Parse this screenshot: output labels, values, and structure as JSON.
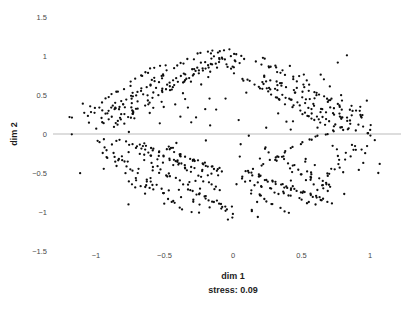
{
  "chart_data": {
    "type": "scatter",
    "title": "",
    "xlabel": "dim 1",
    "ylabel": "dim 2",
    "annotation": "stress: 0.09",
    "xlim": [
      -1.5,
      1.25
    ],
    "ylim": [
      -1.5,
      1.5
    ],
    "grid": false,
    "legend": null,
    "zero_line_y": 0,
    "marker": {
      "color": "#0d0d0d",
      "size_px": 2.3,
      "shape": "circle"
    },
    "xticks": [
      -1,
      -0.5,
      0,
      0.5,
      1
    ],
    "xtick_labels": [
      "−1",
      "−0.5",
      "0",
      "0.5",
      "1"
    ],
    "yticks": [
      1.5,
      1,
      0.5,
      0,
      -0.5,
      -1,
      -1.5
    ],
    "ytick_labels": [
      "1.5",
      "1",
      "0.5",
      "0",
      "−0.5",
      "−1",
      "−1.5"
    ],
    "n_points": 760,
    "x": [
      -1.2,
      -1.16,
      -1.12,
      -1.08,
      -1.05,
      -1.02,
      -0.99,
      -0.97,
      -0.95,
      -0.93,
      -1.1,
      -1.06,
      -1.01,
      -0.98,
      -0.94,
      -0.91,
      -0.89,
      -0.87,
      -0.85,
      -0.83,
      -1.03,
      -0.99,
      -0.96,
      -0.92,
      -0.9,
      -0.88,
      -0.86,
      -0.84,
      -0.82,
      -0.8,
      -0.95,
      -0.92,
      -0.9,
      -0.87,
      -0.85,
      -0.83,
      -0.81,
      -0.79,
      -0.77,
      -0.75,
      -0.91,
      -0.88,
      -0.86,
      -0.84,
      -0.82,
      -0.8,
      -0.78,
      -0.76,
      -0.74,
      -0.72,
      -0.88,
      -0.85,
      -0.83,
      -0.81,
      -0.79,
      -0.77,
      -0.75,
      -0.73,
      -0.71,
      -0.69,
      -0.84,
      -0.82,
      -0.8,
      -0.78,
      -0.76,
      -0.74,
      -0.72,
      -0.7,
      -0.68,
      -0.66,
      -0.8,
      -0.78,
      -0.76,
      -0.74,
      -0.72,
      -0.7,
      -0.68,
      -0.66,
      -0.64,
      -0.62,
      -0.77,
      -0.75,
      -0.73,
      -0.71,
      -0.69,
      -0.67,
      -0.65,
      -0.63,
      -0.61,
      -0.59,
      -0.74,
      -0.72,
      -0.7,
      -0.68,
      -0.66,
      -0.64,
      -0.62,
      -0.6,
      -0.58,
      -0.56,
      -0.71,
      -0.69,
      -0.67,
      -0.65,
      -0.63,
      -0.61,
      -0.59,
      -0.57,
      -0.55,
      -0.53,
      -0.68,
      -0.66,
      -0.64,
      -0.62,
      -0.6,
      -0.58,
      -0.56,
      -0.54,
      -0.52,
      -0.5,
      -0.65,
      -0.63,
      -0.61,
      -0.59,
      -0.57,
      -0.55,
      -0.53,
      -0.51,
      -0.49,
      -0.47,
      -0.62,
      -0.6,
      -0.58,
      -0.56,
      -0.54,
      -0.52,
      -0.5,
      -0.48,
      -0.46,
      -0.44,
      -0.59,
      -0.57,
      -0.55,
      -0.53,
      -0.51,
      -0.49,
      -0.47,
      -0.45,
      -0.43,
      -0.41,
      -0.56,
      -0.54,
      -0.52,
      -0.5,
      -0.48,
      -0.46,
      -0.44,
      -0.42,
      -0.4,
      -0.38,
      -0.53,
      -0.51,
      -0.49,
      -0.47,
      -0.45,
      -0.43,
      -0.41,
      -0.39,
      -0.37,
      -0.35,
      -0.5,
      -0.48,
      -0.46,
      -0.44,
      -0.42,
      -0.4,
      -0.38,
      -0.36,
      -0.34,
      -0.32,
      -0.47,
      -0.45,
      -0.43,
      -0.41,
      -0.39,
      -0.37,
      -0.35,
      -0.33,
      -0.31,
      -0.29,
      -0.44,
      -0.42,
      -0.4,
      -0.38,
      -0.36,
      -0.34,
      -0.32,
      -0.3,
      -0.28,
      -0.26,
      -0.41,
      -0.39,
      -0.37,
      -0.35,
      -0.33,
      -0.31,
      -0.29,
      -0.27,
      -0.25,
      -0.23,
      -0.38,
      -0.36,
      -0.34,
      -0.32,
      -0.3,
      -0.28,
      -0.26,
      -0.24,
      -0.22,
      -0.2,
      -0.35,
      -0.33,
      -0.31,
      -0.29,
      -0.27,
      -0.25,
      -0.23,
      -0.21,
      -0.19,
      -0.17,
      -0.32,
      -0.3,
      -0.28,
      -0.26,
      -0.24,
      -0.22,
      -0.2,
      -0.18,
      -0.16,
      -0.14,
      -0.29,
      -0.27,
      -0.25,
      -0.23,
      -0.21,
      -0.19,
      -0.17,
      -0.15,
      -0.13,
      -0.11,
      -0.26,
      -0.24,
      -0.22,
      -0.2,
      -0.18,
      -0.16,
      -0.14,
      -0.12,
      -0.1,
      -0.08,
      -0.23,
      -0.21,
      -0.19,
      -0.17,
      -0.15,
      -0.13,
      -0.11,
      -0.09,
      -0.07,
      -0.05,
      -0.2,
      -0.18,
      -0.16,
      -0.14,
      -0.12,
      -0.1,
      -0.08,
      -0.06,
      -0.04,
      -0.02,
      -0.17,
      -0.15,
      -0.13,
      -0.11,
      -0.09,
      -0.07,
      -0.05,
      -0.03,
      -0.01,
      0.01,
      -0.14,
      -0.12,
      -0.1,
      -0.08,
      -0.06,
      -0.04,
      -0.02,
      0.0,
      0.02,
      0.04,
      0.06,
      0.08,
      0.1,
      0.12,
      0.14,
      0.16,
      0.18,
      0.2,
      0.22,
      0.24,
      0.09,
      0.11,
      0.13,
      0.15,
      0.17,
      0.19,
      0.21,
      0.23,
      0.25,
      0.27,
      0.12,
      0.14,
      0.16,
      0.18,
      0.2,
      0.22,
      0.24,
      0.26,
      0.28,
      0.3,
      0.15,
      0.17,
      0.19,
      0.21,
      0.23,
      0.25,
      0.27,
      0.29,
      0.31,
      0.33,
      0.18,
      0.2,
      0.22,
      0.24,
      0.26,
      0.28,
      0.3,
      0.32,
      0.34,
      0.36,
      0.21,
      0.23,
      0.25,
      0.27,
      0.29,
      0.31,
      0.33,
      0.35,
      0.37,
      0.39,
      0.24,
      0.26,
      0.28,
      0.3,
      0.32,
      0.34,
      0.36,
      0.38,
      0.4,
      0.42,
      0.27,
      0.29,
      0.31,
      0.33,
      0.35,
      0.37,
      0.39,
      0.41,
      0.43,
      0.45,
      0.3,
      0.32,
      0.34,
      0.36,
      0.38,
      0.4,
      0.42,
      0.44,
      0.46,
      0.48,
      0.33,
      0.35,
      0.37,
      0.39,
      0.41,
      0.43,
      0.45,
      0.47,
      0.49,
      0.51,
      0.36,
      0.38,
      0.4,
      0.42,
      0.44,
      0.46,
      0.48,
      0.5,
      0.52,
      0.54,
      0.39,
      0.41,
      0.43,
      0.45,
      0.47,
      0.49,
      0.51,
      0.53,
      0.55,
      0.57,
      0.42,
      0.44,
      0.46,
      0.48,
      0.5,
      0.52,
      0.54,
      0.56,
      0.58,
      0.6,
      0.45,
      0.47,
      0.49,
      0.51,
      0.53,
      0.55,
      0.57,
      0.59,
      0.61,
      0.63,
      0.48,
      0.5,
      0.52,
      0.54,
      0.56,
      0.58,
      0.6,
      0.62,
      0.64,
      0.66,
      0.51,
      0.53,
      0.55,
      0.57,
      0.59,
      0.61,
      0.63,
      0.65,
      0.67,
      0.69,
      0.54,
      0.56,
      0.58,
      0.6,
      0.62,
      0.64,
      0.66,
      0.68,
      0.7,
      0.72,
      0.57,
      0.59,
      0.61,
      0.63,
      0.65,
      0.67,
      0.69,
      0.71,
      0.73,
      0.75,
      0.6,
      0.62,
      0.64,
      0.66,
      0.68,
      0.7,
      0.72,
      0.74,
      0.76,
      0.78,
      0.63,
      0.65,
      0.67,
      0.69,
      0.71,
      0.73,
      0.75,
      0.77,
      0.79,
      0.81,
      0.66,
      0.68,
      0.7,
      0.72,
      0.74,
      0.76,
      0.78,
      0.8,
      0.82,
      0.84,
      0.7,
      0.73,
      0.76,
      0.79,
      0.82,
      0.85,
      0.88,
      0.91,
      0.94,
      0.97,
      0.75,
      0.78,
      0.81,
      0.84,
      0.87,
      0.9,
      0.93,
      0.96,
      0.99,
      1.02,
      0.8,
      0.83,
      0.86,
      0.89,
      0.92,
      0.95,
      0.98,
      1.01,
      1.04,
      1.05,
      -0.1,
      0.05,
      0.0,
      -0.05,
      0.1,
      0.15,
      -0.15,
      0.2,
      -0.2,
      0.25,
      -0.25,
      0.3,
      -0.3,
      0.35,
      -0.35,
      0.4,
      -0.4,
      0.45,
      -0.45,
      0.5,
      -0.5,
      0.55,
      -0.55,
      0.6,
      -0.6,
      0.65,
      -0.65,
      0.7,
      -0.7,
      0.75,
      -0.75,
      0.8,
      -0.8,
      0.85,
      -0.85,
      0.9,
      -0.9,
      0.95,
      -0.95,
      1.0,
      -0.62,
      0.28,
      -0.42,
      0.62,
      -0.22,
      0.48,
      -0.72,
      0.12,
      -0.12,
      0.88,
      -1.18,
      0.03,
      -0.03,
      0.33,
      -0.33,
      0.53,
      -0.53,
      0.73,
      -0.73,
      0.93,
      -0.08,
      0.18,
      -0.18,
      0.38,
      -0.38,
      0.58,
      -0.58,
      0.78,
      -0.78,
      0.98,
      -0.28,
      0.43,
      -0.48,
      0.68,
      -0.68,
      0.83,
      -0.83,
      0.23,
      -0.23,
      0.07,
      -0.67,
      0.37,
      -0.37,
      0.57,
      -0.57,
      0.77,
      -0.77,
      0.17,
      -0.17,
      0.47,
      -0.47,
      0.67,
      0.27,
      -0.27,
      0.87,
      -0.87,
      0.02,
      -0.02,
      0.52,
      -0.52,
      -0.88,
      0.92,
      -0.92,
      0.22,
      -0.24,
      0.64,
      -0.64,
      0.44,
      -0.44,
      0.84,
      0.31,
      -0.31,
      0.51,
      -0.51,
      0.71,
      -0.71,
      0.91,
      -0.91,
      0.11,
      -0.11,
      -0.55,
      0.35,
      0.15,
      -0.13,
      0.65,
      -0.63,
      0.85,
      -0.85,
      0.05,
      -0.05,
      0.41,
      -0.41,
      0.61,
      -0.61,
      0.81,
      -0.81,
      0.21,
      -0.21,
      0.01,
      -0.01,
      -0.36,
      0.46,
      -0.46,
      0.66,
      -0.66,
      0.86,
      -0.86,
      0.26,
      -0.26,
      0.06,
      0.56,
      -0.56,
      0.76,
      -0.76,
      0.96,
      -0.96,
      0.36,
      0.16,
      -0.16,
      0.04,
      -1.05,
      0.09,
      -0.09,
      0.29,
      -0.29,
      0.49,
      -0.49,
      0.69,
      -0.69,
      0.89,
      0.13,
      -0.14,
      0.34,
      0.54,
      -0.54,
      0.74,
      -0.74,
      0.94,
      -0.94,
      0.24,
      -0.19,
      0.39,
      -0.39,
      0.59,
      -0.59,
      0.79,
      -0.79,
      0.99,
      -0.99,
      0.19,
      -0.34,
      0.32,
      -0.32,
      0.72,
      -0.72,
      0.92,
      -0.93,
      0.52,
      -0.5,
      0.62,
      1.03,
      -1.12,
      0.08,
      -0.07,
      0.43,
      -0.43,
      0.63,
      -0.62,
      0.83,
      -0.82
    ],
    "y": [
      0.21,
      -0.02,
      -0.49,
      0.38,
      0.22,
      0.09,
      -0.1,
      0.35,
      0.3,
      -0.22,
      0.28,
      0.14,
      0.32,
      0.2,
      -0.05,
      0.25,
      0.18,
      0.4,
      0.12,
      -0.28,
      0.34,
      0.26,
      0.16,
      -0.18,
      0.22,
      0.36,
      0.08,
      -0.34,
      0.3,
      0.19,
      0.42,
      0.24,
      -0.12,
      0.33,
      0.15,
      -0.4,
      0.27,
      0.38,
      -0.08,
      0.21,
      0.46,
      0.31,
      -0.25,
      0.17,
      0.4,
      -0.5,
      0.23,
      0.35,
      -0.15,
      0.29,
      0.5,
      0.33,
      -0.3,
      0.2,
      0.44,
      -0.6,
      0.26,
      0.39,
      -0.2,
      0.32,
      0.55,
      0.36,
      -0.35,
      0.24,
      0.48,
      -0.65,
      0.29,
      0.42,
      -0.24,
      0.37,
      0.58,
      0.4,
      -0.42,
      0.28,
      0.52,
      -0.7,
      0.33,
      -0.12,
      0.45,
      0.61,
      0.63,
      0.44,
      -0.46,
      0.31,
      0.56,
      -0.28,
      -0.6,
      0.37,
      0.49,
      0.67,
      0.66,
      0.48,
      -0.52,
      -0.16,
      0.59,
      -0.33,
      -0.64,
      0.41,
      0.53,
      0.71,
      0.7,
      0.52,
      -0.18,
      -0.58,
      0.62,
      -0.37,
      -0.68,
      0.45,
      0.57,
      0.74,
      0.73,
      -0.14,
      -0.22,
      -0.62,
      0.65,
      -0.41,
      -0.72,
      0.49,
      0.6,
      0.77,
      0.76,
      -0.17,
      -0.26,
      -0.66,
      0.68,
      -0.45,
      -0.75,
      0.53,
      0.63,
      0.8,
      0.79,
      -0.2,
      -0.3,
      -0.2,
      0.71,
      -0.48,
      -0.78,
      0.56,
      0.66,
      0.83,
      0.82,
      -0.23,
      -0.33,
      -0.24,
      0.74,
      -0.51,
      -0.82,
      0.59,
      0.69,
      0.86,
      0.85,
      -0.26,
      -0.36,
      -0.28,
      -0.15,
      -0.54,
      -0.86,
      0.62,
      0.72,
      0.89,
      0.88,
      -0.29,
      -0.19,
      -0.32,
      -0.17,
      -0.57,
      -0.9,
      0.65,
      0.75,
      0.92,
      0.55,
      -0.31,
      -0.21,
      -0.35,
      -0.13,
      -0.6,
      -0.94,
      0.68,
      0.78,
      0.95,
      0.58,
      -0.33,
      -0.23,
      -0.38,
      -0.27,
      -0.63,
      -0.97,
      0.71,
      0.81,
      0.98,
      0.61,
      -0.35,
      -0.25,
      -0.41,
      -0.29,
      -0.66,
      -1.0,
      0.74,
      0.84,
      1.01,
      0.64,
      -0.37,
      -0.27,
      -0.44,
      -0.31,
      -0.69,
      -0.73,
      0.77,
      0.87,
      1.04,
      0.67,
      -0.39,
      -0.29,
      -0.47,
      -0.33,
      -0.72,
      -0.76,
      0.8,
      0.9,
      1.06,
      0.7,
      -0.41,
      -0.31,
      -0.5,
      -0.35,
      -0.75,
      -0.79,
      0.83,
      0.93,
      1.08,
      0.73,
      -0.43,
      -0.33,
      -0.53,
      -0.37,
      -0.78,
      -0.82,
      0.86,
      0.96,
      1.02,
      0.76,
      -0.45,
      -0.35,
      -0.56,
      -0.39,
      -0.81,
      -0.85,
      0.89,
      0.99,
      0.94,
      0.79,
      -0.47,
      -0.37,
      -0.59,
      -0.41,
      -0.84,
      -0.88,
      0.92,
      1.05,
      0.97,
      0.82,
      -0.49,
      -0.39,
      -0.62,
      -0.43,
      -0.87,
      -0.91,
      0.95,
      1.09,
      0.86,
      0.85,
      -0.51,
      -0.41,
      -0.65,
      -0.45,
      -0.9,
      -0.94,
      0.98,
      1.07,
      0.88,
      0.88,
      -0.53,
      -0.43,
      -0.68,
      -0.47,
      -0.93,
      -0.97,
      1.01,
      0.84,
      0.91,
      0.91,
      -0.55,
      -0.45,
      -0.71,
      -0.49,
      -0.96,
      -1.1,
      1.04,
      0.8,
      0.93,
      0.72,
      -0.57,
      -0.47,
      -0.74,
      -0.51,
      -0.99,
      -1.06,
      0.66,
      0.76,
      0.95,
      0.69,
      -0.59,
      -0.49,
      -0.77,
      -0.53,
      -0.88,
      -0.4,
      0.63,
      0.73,
      0.87,
      0.66,
      -0.61,
      -0.51,
      -0.8,
      -0.55,
      -0.18,
      -0.37,
      0.6,
      0.7,
      0.84,
      0.63,
      -0.63,
      -0.53,
      -0.83,
      -0.57,
      -0.21,
      -0.34,
      0.57,
      0.67,
      0.81,
      0.6,
      -0.65,
      -0.55,
      -0.86,
      -0.59,
      -0.24,
      -0.31,
      0.54,
      0.64,
      0.78,
      0.57,
      -0.67,
      -0.57,
      -0.89,
      -0.61,
      -0.27,
      -0.28,
      0.51,
      0.61,
      0.75,
      0.54,
      -0.69,
      -0.59,
      -0.92,
      -0.63,
      -0.3,
      -0.25,
      0.48,
      0.58,
      0.72,
      0.51,
      -0.71,
      -0.61,
      -0.95,
      -0.65,
      -0.33,
      -0.22,
      0.45,
      0.55,
      0.69,
      0.48,
      -0.73,
      -0.63,
      -0.98,
      -0.67,
      -0.36,
      -0.19,
      0.42,
      0.52,
      0.66,
      0.45,
      -0.75,
      -0.65,
      -1.01,
      -0.69,
      -0.39,
      -0.16,
      0.39,
      0.49,
      0.63,
      0.42,
      -0.77,
      -0.67,
      -0.45,
      -0.71,
      -0.42,
      -0.13,
      0.36,
      0.46,
      0.6,
      0.39,
      -0.79,
      -0.69,
      -0.48,
      -0.73,
      -0.45,
      -0.11,
      0.33,
      0.43,
      0.57,
      0.36,
      -0.81,
      -0.71,
      -0.51,
      -0.75,
      -0.48,
      -0.09,
      0.3,
      0.4,
      0.54,
      0.33,
      -0.83,
      -0.73,
      -0.54,
      -0.77,
      -0.51,
      -0.07,
      0.27,
      0.37,
      0.51,
      0.3,
      -0.85,
      -0.75,
      -0.57,
      -0.79,
      -0.54,
      -0.05,
      0.24,
      0.34,
      0.48,
      0.27,
      -0.87,
      -0.77,
      -0.6,
      -0.81,
      -0.57,
      -0.03,
      0.21,
      0.31,
      0.45,
      0.24,
      -0.89,
      -0.79,
      -0.63,
      -0.83,
      -0.6,
      -0.01,
      0.18,
      0.28,
      0.42,
      0.21,
      -0.91,
      -0.81,
      -0.66,
      -0.85,
      -0.63,
      0.01,
      0.15,
      0.25,
      0.39,
      0.18,
      -0.7,
      -0.83,
      -0.69,
      -0.87,
      -0.66,
      0.03,
      0.12,
      0.22,
      0.36,
      0.15,
      -0.67,
      -0.55,
      -0.72,
      -0.5,
      -0.69,
      0.05,
      0.09,
      0.19,
      0.33,
      0.12,
      -0.64,
      -0.52,
      -0.44,
      -0.47,
      -0.4,
      0.07,
      0.06,
      0.16,
      0.3,
      0.4,
      0.28,
      -0.3,
      0.5,
      -0.5,
      0.2,
      -0.2,
      0.36,
      -0.36,
      0.1,
      0.32,
      -0.42,
      0.44,
      -0.24,
      0.16,
      -0.16,
      0.26,
      -0.26,
      0.06,
      -0.06,
      0.22,
      -0.34,
      0.12,
      -0.12,
      0.3,
      -0.18,
      0.02,
      -0.02,
      -0.52,
      -0.4,
      0.98,
      1.02,
      -1.07,
      0.44,
      0.52,
      -0.96,
      0.8,
      -0.78,
      0.3,
      0.6,
      0.2,
      -0.33,
      0.67,
      -0.29,
      0.45,
      0.05,
      -0.73,
      0.17,
      -0.17,
      0.25,
      0.36,
      -0.55,
      0.12,
      0.48,
      -0.48,
      0.28,
      -0.11,
      0.33,
      -0.43,
      -0.21,
      0.04,
      0.19,
      -0.37,
      0.08,
      -0.08,
      0.11,
      -0.31,
      0.23,
      0.15,
      0.02,
      -0.68,
      0.86,
      -0.86,
      0.09,
      -0.09,
      0.57,
      -0.57,
      0.71,
      -0.71,
      0.26,
      0.19,
      0.93,
      -0.93,
      0.61,
      -0.61,
      0.41,
      -0.41,
      0.13,
      -0.13,
      0.22,
      1.07,
      -0.76,
      0.74,
      -0.74,
      0.54,
      -0.54,
      0.34,
      -0.34,
      0.14,
      -0.14,
      -0.62,
      0.88,
      -0.88,
      0.68,
      -0.68,
      0.07,
      -0.07,
      0.91,
      -0.91,
      -0.28,
      0.53,
      0.81,
      -0.81,
      0.64,
      -0.64,
      0.24,
      -0.24,
      0.95,
      -0.95,
      0.72,
      -0.72,
      0.47,
      0.84,
      -0.84,
      0.31,
      -0.31,
      1.04,
      -1.04,
      0.77,
      -0.77,
      0.38,
      0.29,
      -0.29,
      0.99,
      -0.99,
      0.18,
      -0.18,
      0.42,
      -0.42,
      1.0,
      0.58,
      0.35,
      -0.35,
      0.89,
      -0.89,
      0.21,
      -0.21,
      0.49,
      -0.49,
      0.96,
      0.65,
      0.46,
      -0.46,
      0.83,
      -0.83,
      0.27,
      -0.27,
      0.56,
      -0.56,
      0.9,
      -0.58,
      0.39,
      -0.39,
      0.79,
      -0.79,
      0.32,
      -0.32,
      0.63,
      -0.63,
      0.85,
      0.73,
      0.51,
      -0.51,
      0.75,
      -0.75,
      0.37,
      -0.37,
      0.69,
      -0.69,
      0.16,
      0.23,
      -0.23,
      0.92,
      -0.92,
      0.43,
      -0.43,
      0.66,
      -0.66,
      0.11,
      -0.11,
      0.3,
      0.97,
      -0.97,
      0.87,
      -0.87,
      0.53,
      -0.53,
      0.59,
      -0.59,
      0.03,
      -0.01,
      0.33,
      -0.33,
      0.7,
      -0.7,
      0.45,
      -0.45,
      0.25,
      -0.25,
      0.08,
      0.44,
      0.17,
      0.2,
      0.55,
      -0.55,
      0.36,
      -0.36,
      0.1,
      -0.1,
      0.62,
      -0.38,
      0.26,
      0.15,
      -0.15,
      0.48,
      -0.47,
      0.29,
      -0.3,
      0.4,
      0.5
    ]
  },
  "axes": {
    "ylabel": "dim 2",
    "xlabel": "dim 1",
    "note": "stress: 0.09"
  }
}
